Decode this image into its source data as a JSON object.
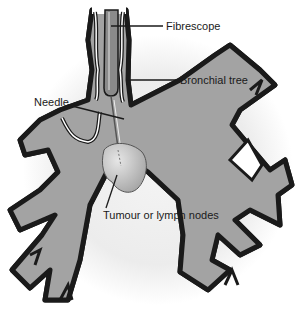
{
  "diagram": {
    "colors": {
      "airway_fill": "#a3a3a3",
      "airway_wall_outer": "#1a1a1a",
      "airway_wall_inner": "#ffffff",
      "backdrop": "#ededed",
      "tumour_fill": "#c8c8c8",
      "scope": "#8a8a8a",
      "leader": "#1a1a1a"
    },
    "labels": {
      "fibrescope": "Fibrescope",
      "bronchial_tree": "Bronchial tree",
      "needle": "Needle",
      "tumour": "Tumour or lymph nodes"
    }
  }
}
